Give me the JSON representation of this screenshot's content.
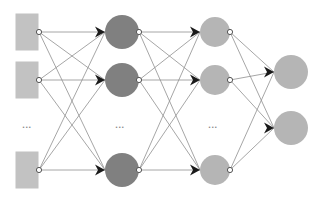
{
  "diagram": {
    "type": "neural-network-architecture",
    "background_color": "#ffffff",
    "canvas": {
      "width": 324,
      "height": 201
    },
    "ellipsis_label": "...",
    "colors": {
      "input_rect_fill": "#c2c2c2",
      "hidden1_fill": "#808080",
      "hidden2_fill": "#b5b5b5",
      "output_fill": "#b5b5b5",
      "edge_stroke": "#8f8f8f",
      "arrowhead_fill": "#1a1a1a",
      "port_stroke": "#555555",
      "port_fill": "#ffffff",
      "ellipsis_fill": "#8a8a8a"
    },
    "layers": [
      {
        "id": "input",
        "name": "Input layer",
        "shape": "rectangle",
        "fill": "#c2c2c2",
        "rect": {
          "width": 23,
          "height": 37
        },
        "nodes": [
          {
            "id": "in-1",
            "x": 27,
            "y": 32
          },
          {
            "id": "in-2",
            "x": 27,
            "y": 80
          },
          {
            "id": "in-3",
            "x": 27,
            "y": 170
          }
        ],
        "ellipsis": {
          "x": 27,
          "y": 128
        },
        "out_port_x": 39
      },
      {
        "id": "hidden-1",
        "name": "Hidden layer 1",
        "shape": "circle",
        "fill": "#808080",
        "radius": 17,
        "nodes": [
          {
            "id": "h1-1",
            "x": 122,
            "y": 32
          },
          {
            "id": "h1-2",
            "x": 122,
            "y": 80
          },
          {
            "id": "h1-3",
            "x": 122,
            "y": 170
          }
        ],
        "ellipsis": {
          "x": 120,
          "y": 128
        },
        "in_port_x": 105,
        "out_port_x": 139
      },
      {
        "id": "hidden-2",
        "name": "Hidden layer 2",
        "shape": "circle",
        "fill": "#b5b5b5",
        "radius": 15,
        "nodes": [
          {
            "id": "h2-1",
            "x": 215,
            "y": 32
          },
          {
            "id": "h2-2",
            "x": 215,
            "y": 80
          },
          {
            "id": "h2-3",
            "x": 215,
            "y": 170
          }
        ],
        "ellipsis": {
          "x": 213,
          "y": 128
        },
        "in_port_x": 200,
        "out_port_x": 230
      },
      {
        "id": "output",
        "name": "Output layer",
        "shape": "circle",
        "fill": "#b5b5b5",
        "radius": 17,
        "nodes": [
          {
            "id": "out-1",
            "x": 291,
            "y": 72
          },
          {
            "id": "out-2",
            "x": 291,
            "y": 128
          }
        ],
        "ellipsis": null,
        "in_port_x": 274
      }
    ],
    "connections": [
      {
        "from_layer": "input",
        "to_layer": "hidden-1",
        "style": "fully-connected"
      },
      {
        "from_layer": "hidden-1",
        "to_layer": "hidden-2",
        "style": "fully-connected"
      },
      {
        "from_layer": "hidden-2",
        "to_layer": "output",
        "style": "fully-connected"
      }
    ]
  }
}
